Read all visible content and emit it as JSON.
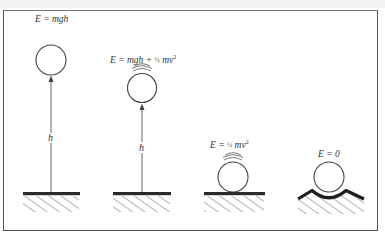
{
  "figure": {
    "colors": {
      "line": "#444444",
      "ground": "#2a2a2a",
      "hatch": "#666666",
      "text": "#333333",
      "frame": "#555555"
    },
    "panels": [
      {
        "id": "panel-1",
        "equation": "E = mgh",
        "height_label": "h",
        "state": "ball held at height h, at rest"
      },
      {
        "id": "panel-2",
        "equation_prefix": "E = mgh + ",
        "fraction": "½",
        "equation_suffix": " mv",
        "exponent": "2",
        "height_label": "h",
        "state": "ball moving at height h"
      },
      {
        "id": "panel-3",
        "equation_prefix": "E = ",
        "fraction": "½",
        "equation_suffix": " mv",
        "exponent": "2",
        "state": "ball moving on flat ground"
      },
      {
        "id": "panel-4",
        "equation": "E = 0",
        "state": "ball at rest in a cradle/dip"
      }
    ]
  }
}
